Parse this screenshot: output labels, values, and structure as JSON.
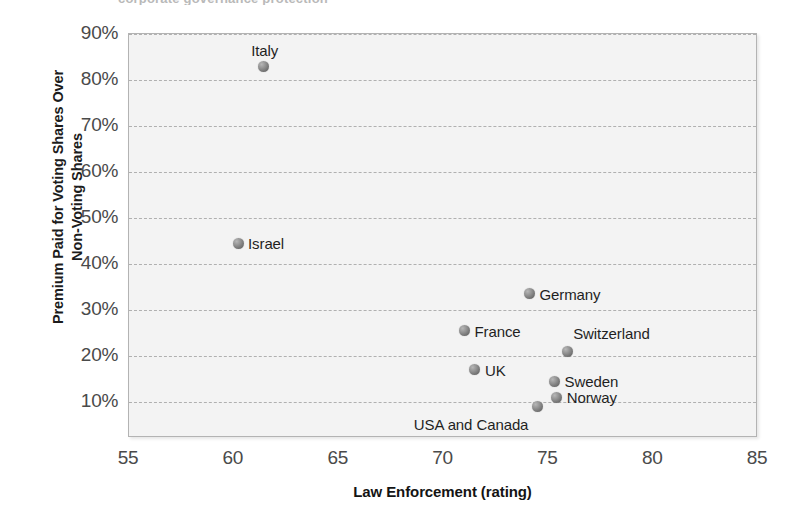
{
  "chart_data": {
    "type": "scatter",
    "title": "corporate governance protection",
    "xlabel": "Law Enforcement (rating)",
    "ylabel_line1": "Premium Paid for Voting Shares Over",
    "ylabel_line2": "Non-Voting Shares",
    "xlim": [
      55,
      85
    ],
    "ylim": [
      5,
      90
    ],
    "xticks": [
      "55",
      "60",
      "65",
      "70",
      "75",
      "80",
      "85"
    ],
    "xtick_values": [
      55,
      60,
      65,
      70,
      75,
      80,
      85
    ],
    "yticks": [
      "10%",
      "20%",
      "30%",
      "40%",
      "50%",
      "60%",
      "70%",
      "80%",
      "90%"
    ],
    "ytick_values": [
      10,
      20,
      30,
      40,
      50,
      60,
      70,
      80,
      90
    ],
    "grid": "horizontal-dashed",
    "legend": "none",
    "marker_color": "#7d7d7d",
    "panel_color": "#f3f3f3",
    "points": [
      {
        "label": "Italy",
        "x": 61.4,
        "y": 83,
        "label_dx": -12,
        "label_dy": -24
      },
      {
        "label": "Israel",
        "x": 60.2,
        "y": 44.5,
        "label_dx": 10,
        "label_dy": -8
      },
      {
        "label": "Germany",
        "x": 74.1,
        "y": 33.5,
        "label_dx": 10,
        "label_dy": -8
      },
      {
        "label": "France",
        "x": 71.0,
        "y": 25.5,
        "label_dx": 10,
        "label_dy": -8
      },
      {
        "label": "Switzerland",
        "x": 75.9,
        "y": 21,
        "label_dx": 6,
        "label_dy": -26
      },
      {
        "label": "UK",
        "x": 71.5,
        "y": 17,
        "label_dx": 10,
        "label_dy": -8
      },
      {
        "label": "Sweden",
        "x": 75.3,
        "y": 14.5,
        "label_dx": 10,
        "label_dy": -8
      },
      {
        "label": "Norway",
        "x": 75.4,
        "y": 11,
        "label_dx": 10,
        "label_dy": -8
      },
      {
        "label": "USA and Canada",
        "x": 74.5,
        "y": 9,
        "label_dx": -124,
        "label_dy": 9
      }
    ]
  }
}
